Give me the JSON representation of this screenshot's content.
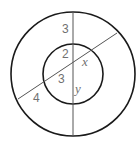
{
  "figure": {
    "colors": {
      "circle_stroke": "#1a1a1a",
      "line_stroke": "#555555",
      "label": "#707070"
    },
    "outer_circle": {
      "cx": 73,
      "cy": 74,
      "r": 62
    },
    "inner_circle": {
      "cx": 73,
      "cy": 74,
      "r": 30
    },
    "vertical_line": {
      "x1": 73,
      "y1": 12,
      "x2": 73,
      "y2": 136
    },
    "secant_line": {
      "x1": 18,
      "y1": 99,
      "x2": 117,
      "y2": 33
    },
    "labels": {
      "outer_top_segment": "3",
      "inner_top_segment": "2",
      "inner_right_segment": "x",
      "inner_left_segment": "3",
      "outer_left_segment": "4",
      "inner_bottom_segment": "y"
    }
  }
}
